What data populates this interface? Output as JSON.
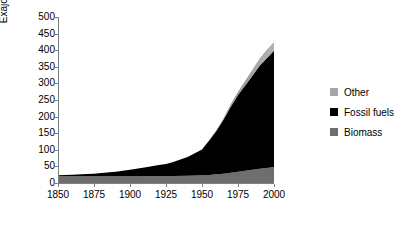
{
  "chart_data": {
    "type": "area",
    "stacked": true,
    "title": "",
    "xlabel": "",
    "ylabel": "Exajoules/Year",
    "xlim": [
      1850,
      2000
    ],
    "ylim": [
      0,
      500
    ],
    "ytick_step": 50,
    "xtick_step": 25,
    "grid": false,
    "legend_position": "right",
    "x": [
      1850,
      1860,
      1870,
      1875,
      1880,
      1890,
      1900,
      1910,
      1920,
      1925,
      1930,
      1940,
      1950,
      1955,
      1960,
      1965,
      1970,
      1975,
      1980,
      1985,
      1990,
      1995,
      2000
    ],
    "series": [
      {
        "name": "Biomass",
        "color": "#6e6e6e",
        "values": [
          20,
          20,
          20,
          20,
          20,
          20,
          20,
          20,
          21,
          21,
          21,
          22,
          23,
          24,
          26,
          28,
          31,
          34,
          37,
          40,
          43,
          45,
          48
        ]
      },
      {
        "name": "Fossil fuels",
        "color": "#000000",
        "values": [
          3,
          5,
          7,
          8,
          10,
          14,
          20,
          27,
          33,
          36,
          42,
          56,
          78,
          104,
          131,
          163,
          199,
          231,
          257,
          283,
          310,
          331,
          350
        ]
      },
      {
        "name": "Other",
        "color": "#a6a6a6",
        "values": [
          0,
          0,
          0,
          0,
          0,
          0,
          0,
          0,
          0,
          0,
          0,
          0,
          0,
          1,
          2,
          4,
          7,
          10,
          14,
          18,
          22,
          25,
          27
        ]
      }
    ],
    "totals": [
      23,
      25,
      27,
      28,
      30,
      34,
      40,
      47,
      54,
      57,
      63,
      78,
      101,
      129,
      159,
      195,
      237,
      275,
      308,
      341,
      375,
      401,
      425
    ],
    "ytick_labels": [
      "0",
      "50",
      "100",
      "150",
      "200",
      "250",
      "300",
      "350",
      "400",
      "450",
      "500"
    ],
    "xtick_labels": [
      "1850",
      "1875",
      "1900",
      "1925",
      "1950",
      "1975",
      "2000"
    ],
    "legend_entries": [
      {
        "label": "Other",
        "color": "#a6a6a6"
      },
      {
        "label": "Fossil fuels",
        "color": "#000000"
      },
      {
        "label": "Biomass",
        "color": "#6e6e6e"
      }
    ]
  }
}
